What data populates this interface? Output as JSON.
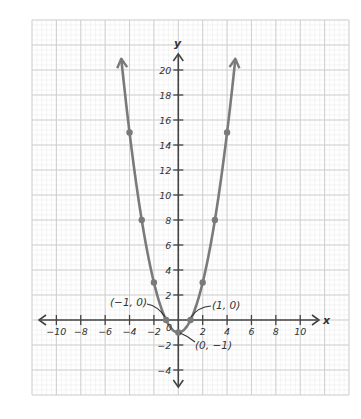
{
  "chart_data": {
    "type": "line",
    "title": "",
    "equation": "y = x^2 - 1",
    "xlabel": "x",
    "ylabel": "y",
    "xlim": [
      -12,
      14
    ],
    "ylim": [
      -6,
      24
    ],
    "grid": true,
    "legend": null,
    "x_ticks": [
      -10,
      -8,
      -6,
      -4,
      -2,
      2,
      4,
      6,
      8,
      10
    ],
    "x_tick_labels": [
      "−10",
      "−8",
      "−6",
      "−4",
      "−2",
      "2",
      "4",
      "6",
      "8",
      "10"
    ],
    "y_ticks": [
      20,
      18,
      16,
      14,
      12,
      10,
      8,
      6,
      4,
      2,
      -2,
      -4
    ],
    "y_tick_labels": [
      "20",
      "18",
      "16",
      "14",
      "12",
      "10",
      "8",
      "6",
      "4",
      "2",
      "−2",
      "−4"
    ],
    "origin_label": "0",
    "series": [
      {
        "name": "y = x^2 - 1",
        "color": "#7a7a7a",
        "x": [
          -4,
          -3,
          -2,
          -1,
          0,
          1,
          2,
          3,
          4
        ],
        "y": [
          15,
          8,
          3,
          0,
          -1,
          0,
          3,
          8,
          15
        ],
        "arrows_at_ends": true
      }
    ],
    "annotations": [
      {
        "text": "(−1, 0)",
        "x": -1,
        "y": 0
      },
      {
        "text": "(1, 0)",
        "x": 1,
        "y": 0
      },
      {
        "text": "(0, −1)",
        "x": 0,
        "y": -1
      }
    ]
  },
  "colors": {
    "curve": "#7a7a7a",
    "axes": "#444444",
    "grid_major": "#cfcfcf",
    "grid_minor": "#ececec",
    "text": "#333333"
  }
}
